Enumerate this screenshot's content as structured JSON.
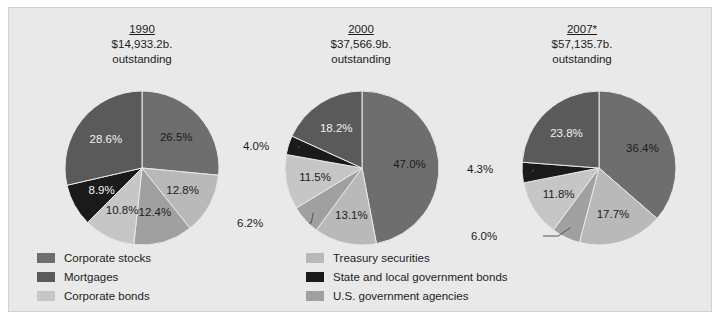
{
  "chart_data": {
    "type": "pie",
    "title": "",
    "legend_position": "bottom",
    "categories": [
      "Corporate stocks",
      "Treasury securities",
      "U.S. government agencies",
      "Corporate bonds",
      "State and local government bonds",
      "Mortgages"
    ],
    "colors": {
      "corporate_stocks": "#6e6e6e",
      "treasury_securities": "#b9b9b9",
      "us_government_agencies": "#a0a0a0",
      "corporate_bonds": "#c6c6c6",
      "state_and_local_government_bonds": "#1a1a1a",
      "mortgages": "#5a5a5a",
      "background": "#e9e9e9",
      "border": "#d2d2d2",
      "text": "#1c1c1c"
    },
    "charts": [
      {
        "id": "pie-1990",
        "year": "1990",
        "amount": "$14,933.2b.",
        "outstanding": "outstanding",
        "values": [
          26.5,
          12.8,
          12.4,
          10.8,
          8.9,
          28.6
        ],
        "labels": [
          "26.5%",
          "12.8%",
          "12.4%",
          "10.8%",
          "8.9%",
          "28.6%"
        ]
      },
      {
        "id": "pie-2000",
        "year": "2000",
        "amount": "$37,566.9b.",
        "outstanding": "outstanding",
        "values": [
          47.0,
          13.1,
          6.2,
          11.5,
          4.0,
          18.2
        ],
        "labels": [
          "47.0%",
          "13.1%",
          "6.2%",
          "11.5%",
          "4.0%",
          "18.2%"
        ]
      },
      {
        "id": "pie-2007",
        "year": "2007*",
        "amount": "$57,135.7b.",
        "outstanding": "outstanding",
        "values": [
          36.4,
          17.7,
          6.0,
          11.8,
          4.3,
          23.8
        ],
        "labels": [
          "36.4%",
          "17.7%",
          "6.0%",
          "11.8%",
          "4.3%",
          "23.8%"
        ]
      }
    ]
  },
  "pies": [
    {
      "year": "1990",
      "amount": "$14,933.2b.",
      "outstanding": "outstanding"
    },
    {
      "year": "2000",
      "amount": "$37,566.9b.",
      "outstanding": "outstanding"
    },
    {
      "year": "2007*",
      "amount": "$57,135.7b.",
      "outstanding": "outstanding"
    }
  ],
  "legend": {
    "left_column": [
      {
        "label": "Corporate stocks",
        "color": "#6e6e6e"
      },
      {
        "label": "Mortgages",
        "color": "#5a5a5a"
      },
      {
        "label": "Corporate bonds",
        "color": "#c6c6c6"
      }
    ],
    "right_column": [
      {
        "label": "Treasury securities",
        "color": "#b9b9b9"
      },
      {
        "label": "State and local government bonds",
        "color": "#1a1a1a"
      },
      {
        "label": "U.S. government agencies",
        "color": "#a0a0a0"
      }
    ]
  }
}
